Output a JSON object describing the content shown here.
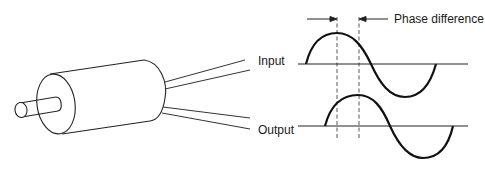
{
  "diagram": {
    "title": "",
    "labels": {
      "phase_difference": "Phase difference",
      "input": "Input",
      "output": "Output"
    },
    "components": {
      "device": "cylindrical-transducer",
      "signals": [
        "input-sine-wave",
        "output-sine-wave"
      ],
      "phase_markers": "dashed-vertical-lines"
    },
    "colors": {
      "stroke": "#111111",
      "background": "#ffffff"
    }
  }
}
